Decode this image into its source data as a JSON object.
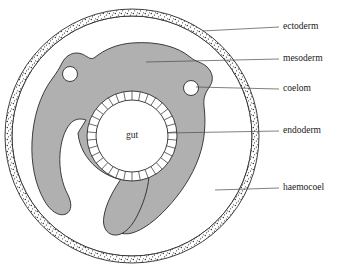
{
  "figure": {
    "title_visible": false,
    "background_color": "#ffffff",
    "outline_color": "#2b2b2b",
    "mesoderm_fill": "#b0b0b0",
    "ectoderm_fill": "#ffffff",
    "stipple_color": "#3a3a3a",
    "leader_color": "#4a4a4a",
    "text_color": "#1a1a1a"
  },
  "center_label": {
    "name": "gut",
    "text": "gut",
    "x": 132,
    "y": 136
  },
  "labels": [
    {
      "id": "ectoderm",
      "text": "ectoderm",
      "text_x": 283,
      "text_y": 27,
      "leader_from_x": 202,
      "leader_from_y": 31,
      "leader_to_x": 279,
      "leader_to_y": 27,
      "points_to": "outer stippled body wall ring"
    },
    {
      "id": "mesoderm",
      "text": "mesoderm",
      "text_x": 283,
      "text_y": 59,
      "leader_from_x": 146,
      "leader_from_y": 62,
      "leader_to_x": 279,
      "leader_to_y": 59,
      "points_to": "grey C-shaped tissue mass"
    },
    {
      "id": "coelom",
      "text": "coelom",
      "text_x": 283,
      "text_y": 89,
      "leader_from_x": 196,
      "leader_from_y": 87,
      "leader_to_x": 279,
      "leader_to_y": 89,
      "points_to": "small white cavity circle in mesoderm"
    },
    {
      "id": "endoderm",
      "text": "endoderm",
      "text_x": 283,
      "text_y": 131,
      "leader_from_x": 167,
      "leader_from_y": 133,
      "leader_to_x": 279,
      "leader_to_y": 131,
      "points_to": "cellular ring lining the gut"
    },
    {
      "id": "haemocoel",
      "text": "haemocoel",
      "text_x": 283,
      "text_y": 188,
      "leader_from_x": 215,
      "leader_from_y": 190,
      "leader_to_x": 279,
      "leader_to_y": 188,
      "points_to": "clear space between body wall and mesoderm"
    }
  ],
  "structures": {
    "body_wall": {
      "name": "ectoderm-ring",
      "center_x": 132,
      "center_y": 136,
      "outer_radius": 127,
      "inner_radius": 120,
      "texture": "stippled"
    },
    "haemocoel": {
      "name": "haemocoel-cavity",
      "center_x": 132,
      "center_y": 136,
      "radius": 120,
      "fill": "#ffffff"
    },
    "gut_lumen": {
      "name": "gut-lumen",
      "center_x": 132,
      "center_y": 136,
      "radius": 36,
      "fill": "#ffffff"
    },
    "endoderm_ring": {
      "name": "endoderm-cell-ring",
      "center_x": 132,
      "center_y": 136,
      "inner_radius": 36,
      "outer_radius": 45,
      "cell_count": 34
    },
    "coelom_left": {
      "name": "coelom-left",
      "center_x": 70,
      "center_y": 74,
      "radius": 7.5
    },
    "coelom_right": {
      "name": "coelom-right",
      "center_x": 191,
      "center_y": 88,
      "radius": 7.5
    }
  },
  "chart_data": {
    "type": "diagram",
    "layers_outward_to_inward": [
      "ectoderm",
      "haemocoel",
      "mesoderm",
      "coelom",
      "endoderm",
      "gut"
    ]
  }
}
